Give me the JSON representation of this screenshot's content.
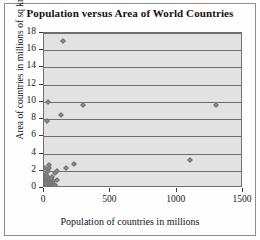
{
  "chart_data": {
    "type": "scatter",
    "title": "Population versus Area of World Countries",
    "xlabel": "Population of countries in millions",
    "ylabel": "Area of countries in millions of sq km",
    "xlim": [
      0,
      1500
    ],
    "ylim": [
      0,
      18
    ],
    "xticks": [
      0,
      500,
      1000,
      1500
    ],
    "yticks": [
      0,
      2,
      4,
      6,
      8,
      10,
      12,
      14,
      16,
      18
    ],
    "grid": "horizontal",
    "legend": "none",
    "marker": "diamond",
    "marker_color": "#8f8f8f",
    "plot_background": "#e2e2e2",
    "points": [
      {
        "x": 143,
        "y": 17.1
      },
      {
        "x": 1300,
        "y": 9.6
      },
      {
        "x": 33,
        "y": 9.98
      },
      {
        "x": 296,
        "y": 9.63
      },
      {
        "x": 127,
        "y": 8.51
      },
      {
        "x": 20,
        "y": 7.74
      },
      {
        "x": 1100,
        "y": 3.29
      },
      {
        "x": 225,
        "y": 2.78
      },
      {
        "x": 163,
        "y": 2.38
      },
      {
        "x": 40,
        "y": 2.72
      },
      {
        "x": 11,
        "y": 2.38
      },
      {
        "x": 35,
        "y": 2.34
      },
      {
        "x": 31,
        "y": 2.0
      },
      {
        "x": 100,
        "y": 1.96
      },
      {
        "x": 80,
        "y": 1.76
      },
      {
        "x": 12,
        "y": 1.62
      },
      {
        "x": 27,
        "y": 1.28
      },
      {
        "x": 61,
        "y": 1.27
      },
      {
        "x": 16,
        "y": 1.25
      },
      {
        "x": 13,
        "y": 1.24
      },
      {
        "x": 18,
        "y": 1.22
      },
      {
        "x": 9,
        "y": 1.1
      },
      {
        "x": 45,
        "y": 1.1
      },
      {
        "x": 51,
        "y": 1.0
      },
      {
        "x": 15,
        "y": 0.92
      },
      {
        "x": 95,
        "y": 0.92
      },
      {
        "x": 28,
        "y": 0.91
      },
      {
        "x": 70,
        "y": 0.8
      },
      {
        "x": 8,
        "y": 0.8
      },
      {
        "x": 6,
        "y": 0.76
      },
      {
        "x": 22,
        "y": 0.75
      },
      {
        "x": 48,
        "y": 0.68
      },
      {
        "x": 26,
        "y": 0.64
      },
      {
        "x": 5,
        "y": 0.64
      },
      {
        "x": 17,
        "y": 0.6
      },
      {
        "x": 38,
        "y": 0.59
      },
      {
        "x": 58,
        "y": 0.58
      },
      {
        "x": 4,
        "y": 0.53
      },
      {
        "x": 24,
        "y": 0.51
      },
      {
        "x": 66,
        "y": 0.51
      },
      {
        "x": 19,
        "y": 0.48
      },
      {
        "x": 7,
        "y": 0.47
      },
      {
        "x": 30,
        "y": 0.45
      },
      {
        "x": 10,
        "y": 0.44
      },
      {
        "x": 41,
        "y": 0.41
      },
      {
        "x": 86,
        "y": 0.39
      },
      {
        "x": 3,
        "y": 0.39
      },
      {
        "x": 14,
        "y": 0.36
      },
      {
        "x": 55,
        "y": 0.34
      },
      {
        "x": 21,
        "y": 0.33
      },
      {
        "x": 2,
        "y": 0.32
      },
      {
        "x": 36,
        "y": 0.31
      },
      {
        "x": 76,
        "y": 0.3
      },
      {
        "x": 11,
        "y": 0.3
      },
      {
        "x": 5,
        "y": 0.28
      },
      {
        "x": 44,
        "y": 0.27
      },
      {
        "x": 25,
        "y": 0.24
      },
      {
        "x": 9,
        "y": 0.24
      },
      {
        "x": 64,
        "y": 0.24
      },
      {
        "x": 16,
        "y": 0.23
      },
      {
        "x": 3,
        "y": 0.21
      },
      {
        "x": 33,
        "y": 0.2
      },
      {
        "x": 82,
        "y": 0.19
      },
      {
        "x": 7,
        "y": 0.18
      },
      {
        "x": 12,
        "y": 0.17
      },
      {
        "x": 49,
        "y": 0.15
      },
      {
        "x": 23,
        "y": 0.14
      },
      {
        "x": 4,
        "y": 0.13
      },
      {
        "x": 6,
        "y": 0.12
      },
      {
        "x": 29,
        "y": 0.11
      },
      {
        "x": 15,
        "y": 0.11
      },
      {
        "x": 2,
        "y": 0.1
      },
      {
        "x": 8,
        "y": 0.09
      },
      {
        "x": 53,
        "y": 0.09
      },
      {
        "x": 20,
        "y": 0.08
      },
      {
        "x": 10,
        "y": 0.07
      },
      {
        "x": 1,
        "y": 0.07
      },
      {
        "x": 40,
        "y": 0.06
      },
      {
        "x": 5,
        "y": 0.05
      },
      {
        "x": 18,
        "y": 0.05
      },
      {
        "x": 3,
        "y": 0.04
      },
      {
        "x": 70,
        "y": 0.04
      },
      {
        "x": 13,
        "y": 0.03
      },
      {
        "x": 1,
        "y": 0.03
      },
      {
        "x": 27,
        "y": 0.02
      },
      {
        "x": 6,
        "y": 0.02
      },
      {
        "x": 2,
        "y": 0.01
      },
      {
        "x": 9,
        "y": 0.01
      },
      {
        "x": 35,
        "y": 0.01
      },
      {
        "x": 1,
        "y": 0.005
      }
    ]
  }
}
